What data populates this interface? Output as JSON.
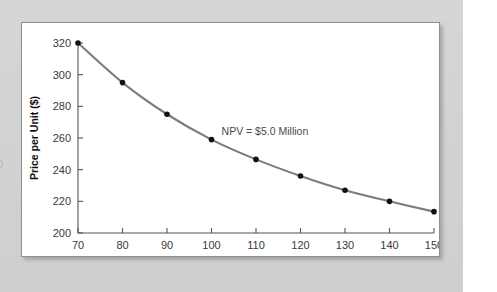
{
  "figure": {
    "panel_background": "#ffffff",
    "panel_border_color": "#8f8f8f",
    "page_background": "#d4d4d4",
    "edge_bleed_glyph": "0"
  },
  "chart_data": {
    "type": "line",
    "title": "",
    "subtitle": "",
    "xlabel": "Annual Units Sold (000s)",
    "ylabel": "Price per Unit ($)",
    "xlim": [
      70,
      150
    ],
    "ylim": [
      200,
      320
    ],
    "xticks": [
      70,
      80,
      90,
      100,
      110,
      120,
      130,
      140,
      150
    ],
    "xtick_labels": [
      "70",
      "80",
      "90",
      "100",
      "110",
      "120",
      "130",
      "140",
      "150"
    ],
    "yticks": [
      200,
      220,
      240,
      260,
      280,
      300,
      320
    ],
    "ytick_labels": [
      "200",
      "220",
      "240",
      "260",
      "280",
      "300",
      "320"
    ],
    "grid": false,
    "legend": null,
    "legend_position": "none",
    "marker": "circle",
    "marker_color": "#111111",
    "line_color": "#7c7c7c",
    "x": [
      70,
      80,
      90,
      100,
      110,
      120,
      130,
      140,
      150
    ],
    "series": [
      {
        "name": "Price per Unit",
        "values": [
          320,
          295,
          275,
          259,
          246.5,
          236,
          227,
          220,
          213.5
        ]
      }
    ],
    "annotations": [
      {
        "text": "NPV = $5.0 Million",
        "x": 112,
        "y": 262
      }
    ]
  }
}
